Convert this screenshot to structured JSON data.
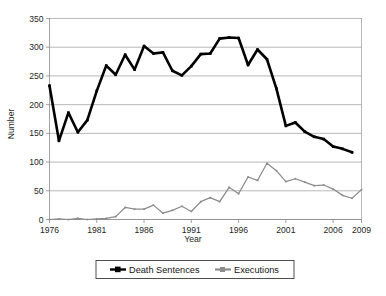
{
  "chart_data": {
    "type": "line",
    "title": "",
    "xlabel": "Year",
    "ylabel": "Number",
    "xlim": [
      1976,
      2009
    ],
    "ylim": [
      0,
      350
    ],
    "ytick_values": [
      0,
      50,
      100,
      150,
      200,
      250,
      300,
      350
    ],
    "ytick_labels": [
      "0",
      "50",
      "100",
      "150",
      "200",
      "250",
      "300",
      "350"
    ],
    "xtick_values": [
      1976,
      1981,
      1986,
      1991,
      1996,
      2001,
      2006,
      2009
    ],
    "xtick_labels": [
      "1976",
      "1981",
      "1986",
      "1991",
      "1996",
      "2001",
      "2006",
      "2009"
    ],
    "grid": "horizontal",
    "legend_position": "bottom-center",
    "x": [
      1976,
      1977,
      1978,
      1979,
      1980,
      1981,
      1982,
      1983,
      1984,
      1985,
      1986,
      1987,
      1988,
      1989,
      1990,
      1991,
      1992,
      1993,
      1994,
      1995,
      1996,
      1997,
      1998,
      1999,
      2000,
      2001,
      2002,
      2003,
      2004,
      2005,
      2006,
      2007,
      2008
    ],
    "series": [
      {
        "name": "Death Sentences",
        "color": "#000000",
        "marker": "filled-square",
        "values": [
          233,
          137,
          186,
          152,
          173,
          224,
          268,
          252,
          287,
          261,
          302,
          289,
          291,
          259,
          251,
          267,
          288,
          289,
          315,
          317,
          316,
          269,
          296,
          279,
          228,
          163,
          169,
          153,
          144,
          140,
          127,
          123,
          117
        ]
      },
      {
        "name": "Executions",
        "color": "#8c8c8c",
        "marker": "filled-square",
        "values": [
          0,
          1,
          0,
          2,
          0,
          1,
          2,
          5,
          21,
          18,
          18,
          25,
          11,
          16,
          23,
          14,
          31,
          38,
          31,
          56,
          45,
          74,
          68,
          98,
          85,
          66,
          71,
          65,
          59,
          60,
          53,
          42,
          37
        ]
      }
    ],
    "last_point_note": {
      "x": 2009,
      "executions": 52
    }
  },
  "legend": {
    "entries": [
      {
        "label": "Death Sentences",
        "color": "#000000"
      },
      {
        "label": "Executions",
        "color": "#8c8c8c"
      }
    ]
  },
  "footer": {
    "smudge_text": ""
  }
}
